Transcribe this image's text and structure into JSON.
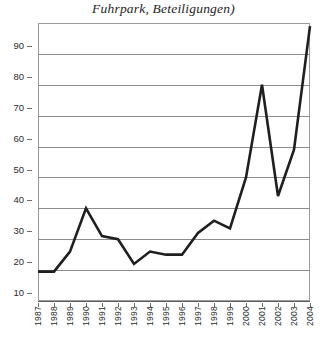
{
  "chart_data": {
    "type": "line",
    "title": "Fuhrpark, Beteiligungen)",
    "xlabel": "",
    "ylabel": "",
    "categories": [
      "1987",
      "1988",
      "1989",
      "1990",
      "1991",
      "1992",
      "1993",
      "1994",
      "1995",
      "1996",
      "1997",
      "1998",
      "1999",
      "2000",
      "2001",
      "2002",
      "2003",
      "2004"
    ],
    "values": [
      9.5,
      9.5,
      16,
      30,
      21,
      20,
      12,
      16,
      15,
      15,
      22,
      26,
      23.5,
      40,
      70,
      34,
      49,
      89
    ],
    "series": [
      {
        "name": "Fuhrpark, Beteiligungen",
        "values": [
          9.5,
          9.5,
          16,
          30,
          21,
          20,
          12,
          16,
          15,
          15,
          22,
          26,
          23.5,
          40,
          70,
          34,
          49,
          89
        ]
      }
    ],
    "ylim": [
      0,
      90
    ],
    "xlim": [
      "1987",
      "2004"
    ],
    "yticks": [
      10,
      20,
      30,
      40,
      50,
      60,
      70,
      80,
      90
    ],
    "ytick_labels": [
      "10",
      "20",
      "30",
      "40",
      "50",
      "60",
      "70",
      "80",
      "90"
    ],
    "xtick_labels": [
      "1987",
      "1988",
      "1989",
      "1990",
      "1991",
      "1992",
      "1993",
      "1994",
      "1995",
      "1996",
      "1997",
      "1998",
      "1999",
      "2000",
      "2001",
      "2002",
      "2003",
      "2004"
    ],
    "grid": true,
    "grid_axis": "y",
    "legend": false,
    "legend_position": "none",
    "line_color": "#1f1f1f",
    "grid_color": "#8d8d8d",
    "background_color": "#ffffff",
    "markers": false
  }
}
